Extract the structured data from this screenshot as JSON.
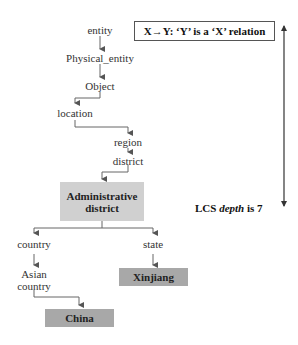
{
  "legend": {
    "text": "X→Y: ‘Y’ is a ‘X’ relation"
  },
  "nodes": {
    "entity": "entity",
    "physical_entity": "Physical_entity",
    "object": "Object",
    "location": "location",
    "region": "region",
    "district": "district",
    "administrative_district_line1": "Administrative",
    "administrative_district_line2": "district",
    "country": "country",
    "state": "state",
    "asian_country_line1": "Asian",
    "asian_country_line2": "country",
    "xinjiang": "Xinjiang",
    "china": "China"
  },
  "lcs": {
    "prefix": "LCS ",
    "italic": "depth",
    "suffix": " is 7"
  },
  "colors": {
    "box_light": "#d0d0d0",
    "box_dark": "#a8a8a8",
    "line": "#555555"
  }
}
